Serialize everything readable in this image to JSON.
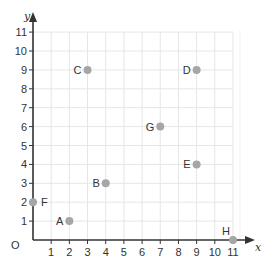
{
  "chart_data": {
    "type": "scatter",
    "title": "",
    "xlabel": "x",
    "ylabel": "y",
    "origin_label": "O",
    "xlim": [
      0,
      11
    ],
    "ylim": [
      0,
      11
    ],
    "grid": true,
    "x_ticks": [
      1,
      2,
      3,
      4,
      5,
      6,
      7,
      8,
      9,
      10,
      11
    ],
    "y_ticks": [
      1,
      2,
      3,
      4,
      5,
      6,
      7,
      8,
      9,
      10,
      11
    ],
    "points": [
      {
        "label": "A",
        "x": 2,
        "y": 1,
        "label_side": "left"
      },
      {
        "label": "B",
        "x": 4,
        "y": 3,
        "label_side": "left"
      },
      {
        "label": "C",
        "x": 3,
        "y": 9,
        "label_side": "left"
      },
      {
        "label": "D",
        "x": 9,
        "y": 9,
        "label_side": "left"
      },
      {
        "label": "E",
        "x": 9,
        "y": 4,
        "label_side": "left"
      },
      {
        "label": "F",
        "x": 0,
        "y": 2,
        "label_side": "right"
      },
      {
        "label": "G",
        "x": 7,
        "y": 6,
        "label_side": "left"
      },
      {
        "label": "H",
        "x": 11,
        "y": 0,
        "label_side": "above-left"
      }
    ],
    "colors": {
      "point": "#a6a6a6",
      "grid": "#e6e6e6",
      "axis": "#333333",
      "text": "#333333"
    }
  }
}
